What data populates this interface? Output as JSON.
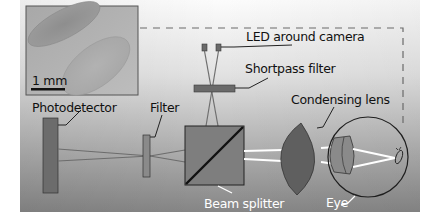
{
  "figure": {
    "type": "optical-setup-schematic",
    "background_gradient": {
      "top": "#fbfbfb",
      "bottom": "#878787"
    }
  },
  "inset": {
    "scale_bar_label": "1 mm",
    "description": "micrograph of two elongated oval objects"
  },
  "labels": {
    "led": "LED around camera",
    "shortpass": "Shortpass filter",
    "photodetector": "Photodetector",
    "filter": "Filter",
    "condensing_lens": "Condensing lens",
    "beam_splitter": "Beam splitter",
    "eye": "Eye"
  },
  "colors": {
    "component_fill": "#6e6e6e",
    "component_dark": "#555555",
    "beam_white": "#ffffff",
    "beam_gray": "#707070",
    "outline": "#2a2a2a",
    "dash": "#6a6a6a"
  }
}
